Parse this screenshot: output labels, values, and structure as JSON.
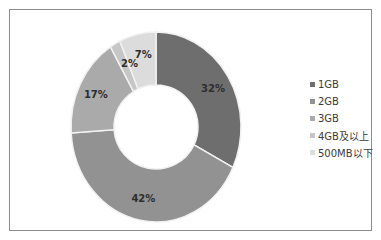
{
  "chart_data": {
    "type": "pie",
    "subtype": "donut",
    "title": "",
    "categories": [
      "1GB",
      "2GB",
      "3GB",
      "4GB及以上",
      "500MB以下"
    ],
    "values": [
      32,
      42,
      17,
      2,
      7
    ],
    "labels": [
      "32%",
      "42%",
      "17%",
      "2%",
      "7%"
    ],
    "unit": "%",
    "colors": [
      "#6e6e6e",
      "#929292",
      "#aaaaaa",
      "#c6c6c6",
      "#dcdcdc"
    ],
    "start_angle": "12 o'clock, clockwise",
    "legend_position": "right"
  },
  "legend": {
    "items": [
      {
        "label": "1GB",
        "color": "#6e6e6e"
      },
      {
        "label": "2GB",
        "color": "#929292"
      },
      {
        "label": "3GB",
        "color": "#aaaaaa"
      },
      {
        "label": "4GB及以上",
        "color": "#c6c6c6"
      },
      {
        "label": "500MB以下",
        "color": "#dcdcdc"
      }
    ]
  }
}
